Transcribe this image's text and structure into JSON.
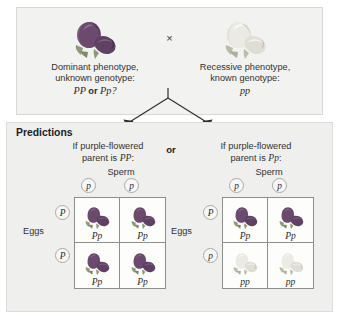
{
  "parents": {
    "left": {
      "flower_icon": "purple-pea-flower-icon",
      "flower_color": "#6b4a6e",
      "caption_line1": "Dominant phenotype,",
      "caption_line2": "unknown genotype:",
      "genotype_a": "PP",
      "genotype_conjunction": "or",
      "genotype_b": "Pp?"
    },
    "cross_symbol": "×",
    "right": {
      "flower_icon": "white-pea-flower-icon",
      "flower_color": "#e8e6e0",
      "caption_line1": "Recessive phenotype,",
      "caption_line2": "known genotype:",
      "genotype": "pp"
    }
  },
  "predictions": {
    "title": "Predictions",
    "or_label": "or",
    "blocks": [
      {
        "heading_line1": "If purple-flowered",
        "heading_prefix": "parent is ",
        "heading_genotype": "PP",
        "heading_suffix": ":",
        "sperm_label": "Sperm",
        "eggs_label": "Eggs",
        "sperm_gametes": [
          "p",
          "p"
        ],
        "egg_gametes": [
          "P",
          "P"
        ],
        "cells": [
          {
            "genotype": "Pp",
            "phenotype": "purple",
            "flower_icon": "purple-pea-flower-icon"
          },
          {
            "genotype": "Pp",
            "phenotype": "purple",
            "flower_icon": "purple-pea-flower-icon"
          },
          {
            "genotype": "Pp",
            "phenotype": "purple",
            "flower_icon": "purple-pea-flower-icon"
          },
          {
            "genotype": "Pp",
            "phenotype": "purple",
            "flower_icon": "purple-pea-flower-icon"
          }
        ]
      },
      {
        "heading_line1": "If purple-flowered",
        "heading_prefix": "parent is ",
        "heading_genotype": "Pp",
        "heading_suffix": ":",
        "sperm_label": "Sperm",
        "eggs_label": "Eggs",
        "sperm_gametes": [
          "p",
          "p"
        ],
        "egg_gametes": [
          "P",
          "p"
        ],
        "cells": [
          {
            "genotype": "Pp",
            "phenotype": "purple",
            "flower_icon": "purple-pea-flower-icon"
          },
          {
            "genotype": "Pp",
            "phenotype": "purple",
            "flower_icon": "purple-pea-flower-icon"
          },
          {
            "genotype": "pp",
            "phenotype": "white",
            "flower_icon": "white-pea-flower-icon"
          },
          {
            "genotype": "pp",
            "phenotype": "white",
            "flower_icon": "white-pea-flower-icon"
          }
        ]
      }
    ]
  },
  "colors": {
    "purple_flower": "#6b4a6e",
    "white_flower": "#ebe9e3",
    "panel_background": "#efefed",
    "parent_panel_background": "#f2f2f1",
    "grid_line": "#8e8e8b",
    "arrow": "#2f2f2f"
  }
}
